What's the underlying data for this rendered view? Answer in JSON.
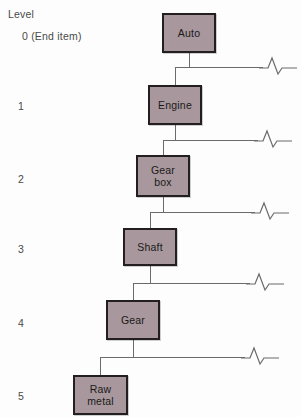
{
  "diagram": {
    "level_column_heading": "Level",
    "box_fill_color": "#a8979c",
    "box_border_color": "#231f20",
    "connector_color": "#6b6b6b",
    "background_color": "#fdfdfd",
    "levels": [
      {
        "id": "level-0",
        "label": "0 (End item)",
        "x": 22,
        "y": 30
      },
      {
        "id": "level-1",
        "label": "1",
        "x": 18,
        "y": 100
      },
      {
        "id": "level-2",
        "label": "2",
        "x": 18,
        "y": 173
      },
      {
        "id": "level-3",
        "label": "3",
        "x": 18,
        "y": 243
      },
      {
        "id": "level-4",
        "label": "4",
        "x": 18,
        "y": 317
      },
      {
        "id": "level-5",
        "label": "5",
        "x": 18,
        "y": 390
      }
    ],
    "nodes": [
      {
        "id": "node-auto",
        "name": "auto",
        "lines": [
          "Auto"
        ],
        "level": 0,
        "x": 162,
        "y": 13,
        "w": 54,
        "h": 40
      },
      {
        "id": "node-engine",
        "name": "engine",
        "lines": [
          "Engine"
        ],
        "level": 1,
        "x": 148,
        "y": 85,
        "w": 54,
        "h": 40
      },
      {
        "id": "node-gearbox",
        "name": "gear-box",
        "lines": [
          "Gear",
          "box"
        ],
        "level": 2,
        "x": 136,
        "y": 155,
        "w": 54,
        "h": 42
      },
      {
        "id": "node-shaft",
        "name": "shaft",
        "lines": [
          "Shaft"
        ],
        "level": 3,
        "x": 123,
        "y": 228,
        "w": 54,
        "h": 38
      },
      {
        "id": "node-gear",
        "name": "gear",
        "lines": [
          "Gear"
        ],
        "level": 4,
        "x": 106,
        "y": 300,
        "w": 54,
        "h": 40
      },
      {
        "id": "node-rawmetal",
        "name": "raw-metal",
        "lines": [
          "Raw",
          "metal"
        ],
        "level": 5,
        "x": 73,
        "y": 375,
        "w": 55,
        "h": 40
      }
    ],
    "connectors": [
      {
        "id": "conn-auto-engine",
        "from": "auto",
        "to": "engine",
        "drop_x": 189,
        "drop_top": 53,
        "bus_y": 67,
        "bus_left": 175,
        "bus_right": 263,
        "child_x": 175,
        "child_top": 67,
        "child_bottom": 85
      },
      {
        "id": "conn-engine-gearbox",
        "from": "engine",
        "to": "gear-box",
        "drop_x": 175,
        "drop_top": 125,
        "bus_y": 140,
        "bus_left": 163,
        "bus_right": 258,
        "child_x": 163,
        "child_top": 140,
        "child_bottom": 155
      },
      {
        "id": "conn-gearbox-shaft",
        "from": "gear-box",
        "to": "shaft",
        "drop_x": 163,
        "drop_top": 197,
        "bus_y": 212,
        "bus_left": 150,
        "bus_right": 255,
        "child_x": 150,
        "child_top": 212,
        "child_bottom": 228
      },
      {
        "id": "conn-shaft-gear",
        "from": "shaft",
        "to": "gear",
        "drop_x": 150,
        "drop_top": 266,
        "bus_y": 283,
        "bus_left": 133,
        "bus_right": 250,
        "child_x": 133,
        "child_top": 283,
        "child_bottom": 300
      },
      {
        "id": "conn-gear-rawmetal",
        "from": "gear",
        "to": "raw-metal",
        "drop_x": 133,
        "drop_top": 340,
        "bus_y": 357,
        "bus_left": 100,
        "bus_right": 245,
        "child_x": 100,
        "child_top": 357,
        "child_bottom": 375
      }
    ],
    "break_symbols": [
      {
        "id": "break-0",
        "after": "auto",
        "x": 259,
        "y": 55
      },
      {
        "id": "break-1",
        "after": "engine",
        "x": 254,
        "y": 128
      },
      {
        "id": "break-2",
        "after": "gear-box",
        "x": 251,
        "y": 200
      },
      {
        "id": "break-3",
        "after": "shaft",
        "x": 246,
        "y": 271
      },
      {
        "id": "break-4",
        "after": "gear",
        "x": 241,
        "y": 345
      }
    ]
  }
}
